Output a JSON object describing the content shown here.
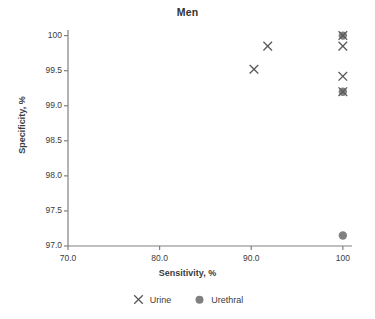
{
  "chart_data": {
    "type": "scatter",
    "title": "Men",
    "xlabel": "Sensitivity, %",
    "ylabel": "Specificity, %",
    "xlim": [
      70.0,
      101.0
    ],
    "ylim": [
      97.0,
      100.08
    ],
    "xticks": [
      70.0,
      80.0,
      90.0,
      100.0
    ],
    "xtick_labels": [
      "70.0",
      "80.0",
      "90.0",
      "100"
    ],
    "yticks": [
      97.0,
      97.5,
      98.0,
      98.5,
      99.0,
      99.5,
      100.0
    ],
    "ytick_labels": [
      "97.0",
      "97.5",
      "98.0",
      "98.5",
      "99.0",
      "99.5",
      "100"
    ],
    "grid": false,
    "legend_position": "bottom",
    "series": [
      {
        "name": "Urine",
        "marker": "x",
        "color": "#595959",
        "points": [
          {
            "x": 100.0,
            "y": 100.0
          },
          {
            "x": 91.8,
            "y": 99.85
          },
          {
            "x": 100.0,
            "y": 99.85
          },
          {
            "x": 90.3,
            "y": 99.52
          },
          {
            "x": 100.0,
            "y": 99.42
          },
          {
            "x": 100.0,
            "y": 99.2
          }
        ]
      },
      {
        "name": "Urethral",
        "marker": "circle",
        "color": "#808080",
        "points": [
          {
            "x": 100.0,
            "y": 100.0
          },
          {
            "x": 100.0,
            "y": 99.2
          },
          {
            "x": 100.0,
            "y": 97.15
          }
        ]
      }
    ]
  },
  "legend": {
    "items": [
      {
        "label": "Urine",
        "marker": "x",
        "color": "#595959"
      },
      {
        "label": "Urethral",
        "marker": "circle",
        "color": "#808080"
      }
    ]
  },
  "axes": {
    "line_color": "#808080"
  }
}
